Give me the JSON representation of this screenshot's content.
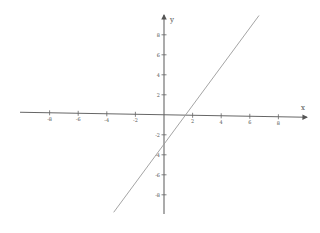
{
  "chart_data": {
    "type": "line",
    "title": "",
    "xlabel": "x",
    "ylabel": "y",
    "xlim": [
      -10,
      10
    ],
    "ylim": [
      -10,
      10
    ],
    "grid": false,
    "x_ticks": [
      -8,
      -6,
      -4,
      -2,
      2,
      4,
      6,
      8
    ],
    "y_ticks": [
      8,
      6,
      4,
      2,
      -2,
      -4,
      -6,
      -8
    ],
    "x_tick_labels": [
      "-8",
      "-6",
      "-4",
      "-2",
      "2",
      "4",
      "6",
      "8"
    ],
    "y_tick_labels": [
      "8",
      "6",
      "4",
      "2",
      "-2",
      "-4",
      "-6",
      "-8"
    ],
    "series": [
      {
        "name": "y = 2x - 3",
        "equation": "y = 2x - 3",
        "x": [
          -3.5,
          6.5
        ],
        "y": [
          -10,
          10
        ],
        "slope": 2,
        "intercept": -3,
        "x_intercept": 1.5,
        "color": "#888888"
      }
    ],
    "axis_color": "#555555"
  },
  "axes": {
    "x_name": "x",
    "y_name": "y"
  }
}
